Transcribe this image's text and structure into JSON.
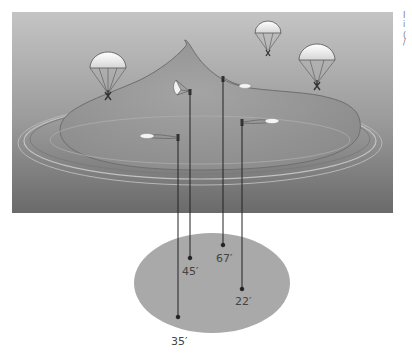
{
  "diagram": {
    "scene": {
      "panel_color_top": "#c8c8c8",
      "panel_color_bottom": "#6e6e6e",
      "mountain_color": "#9a9a9a",
      "ground_ellipse_color": "#a8a8a8"
    },
    "parachutes": [
      {
        "id": "chute-1",
        "state": "open",
        "x": 110,
        "y": 70
      },
      {
        "id": "chute-2",
        "state": "open",
        "x": 268,
        "y": 38
      },
      {
        "id": "chute-3",
        "state": "open",
        "x": 318,
        "y": 65
      },
      {
        "id": "chute-4",
        "state": "partial",
        "x": 181,
        "y": 90
      },
      {
        "id": "chute-5",
        "state": "collapsed",
        "x": 223,
        "y": 82
      },
      {
        "id": "chute-6",
        "state": "collapsed",
        "x": 178,
        "y": 138
      },
      {
        "id": "chute-7",
        "state": "collapsed",
        "x": 242,
        "y": 124
      }
    ],
    "drop_lines": [
      {
        "id": "drop-35",
        "x": 178,
        "y_start": 140,
        "y_end": 318,
        "label": "35′",
        "label_x": 170,
        "label_y": 324
      },
      {
        "id": "drop-45",
        "x": 190,
        "y_start": 94,
        "y_end": 259,
        "label": "45′",
        "label_x": 182,
        "label_y": 265
      },
      {
        "id": "drop-67",
        "x": 223,
        "y_start": 79,
        "y_end": 246,
        "label": "67′",
        "label_x": 216,
        "label_y": 252
      },
      {
        "id": "drop-22",
        "x": 242,
        "y_start": 125,
        "y_end": 290,
        "label": "22′",
        "label_x": 235,
        "label_y": 296
      }
    ],
    "edge_text": [
      "I",
      "i",
      "(",
      "/"
    ]
  }
}
